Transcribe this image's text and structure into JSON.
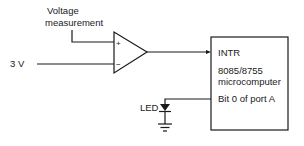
{
  "diagram": {
    "inputs": {
      "voltage_measurement_line1": "Voltage",
      "voltage_measurement_line2": "measurement",
      "reference": "3 V"
    },
    "comparator": {
      "plus_sign": "+",
      "minus_sign": "−"
    },
    "microcomputer": {
      "interrupt_pin": "INTR",
      "model": "8085/8755",
      "type": "microcomputer",
      "output_pin": "Bit 0 of port A"
    },
    "led": {
      "label": "LED"
    }
  }
}
